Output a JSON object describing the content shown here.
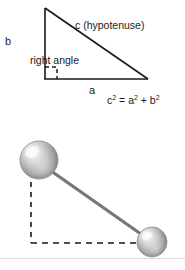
{
  "figure": {
    "background_color": "#ffffff",
    "line_color": "#1a1a1a",
    "rule_color": "#dcdcdc"
  },
  "triangle_diagram": {
    "name": "right-triangle",
    "labels": {
      "vertical_leg": "b",
      "horizontal_leg": "a",
      "hypotenuse": "c  (hypotenuse)",
      "right_angle": "right angle"
    },
    "equation": {
      "c": "c",
      "c_exp": "2",
      "equals": " = ",
      "a": "a",
      "a_exp": "2",
      "plus": " + ",
      "b": "b",
      "b_exp": "2",
      "plain": "c2 = a2 + b2"
    }
  },
  "distance_diagram": {
    "name": "two-point-distance",
    "labels": {
      "vertical_delta": "y",
      "horizontal_delta": "x",
      "distance_expression": "Math.sqrt(x*x + y*y)"
    },
    "spheres": [
      {
        "name": "sphere-origin",
        "cx": 39,
        "cy": 160,
        "r": 19
      },
      {
        "name": "sphere-target",
        "cx": 152,
        "cy": 242,
        "r": 15
      }
    ],
    "sphere_colors": {
      "highlight": "#f2f2f2",
      "mid": "#b8b8b8",
      "shadow": "#666666",
      "edge": "#888888"
    },
    "connector_color": "#777777"
  }
}
